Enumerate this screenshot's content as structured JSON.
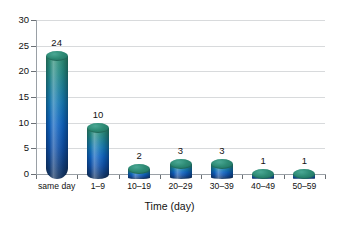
{
  "chart_data": {
    "type": "bar",
    "title": "",
    "subtitle": "",
    "xlabel": "Time (day)",
    "ylabel": "",
    "categories": [
      "same day",
      "1–9",
      "10–19",
      "20–29",
      "30–39",
      "40–49",
      "50–59"
    ],
    "values": [
      24,
      10,
      2,
      3,
      3,
      1,
      1
    ],
    "data_labels": [
      "24",
      "10",
      "2",
      "3",
      "3",
      "1",
      "1"
    ],
    "ylim": [
      0,
      30
    ],
    "ytick_labels": [
      "0",
      "5",
      "10",
      "15",
      "20",
      "25",
      "30"
    ],
    "ytick_values": [
      0,
      5,
      10,
      15,
      20,
      25,
      30
    ],
    "grid": "horizontal",
    "legend": "none",
    "legend_position": "none",
    "style": "3d-cylinder",
    "colors": {
      "cap": "#2d8a74",
      "body_top": "#2f8f73",
      "body_mid": "#0e63c0",
      "body_bottom": "#16355f",
      "gridline": "#d8dadc",
      "axis": "#9aa0a6",
      "text": "#111111",
      "background": "#ffffff"
    }
  }
}
